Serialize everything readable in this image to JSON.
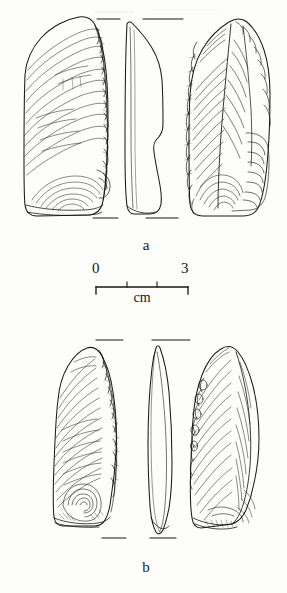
{
  "plate": {
    "type": "archaeological-lithic-illustration",
    "background_color": "#fdfdfc",
    "ink_color": "#1a1a1a",
    "width": 287,
    "height": 593
  },
  "figures": [
    {
      "id": "a",
      "label": "a",
      "label_x": 126,
      "label_y": 240,
      "views": [
        "ventral",
        "profile",
        "dorsal"
      ],
      "registration_ticks": {
        "top_y": 19,
        "bottom_y": 218,
        "segments": [
          [
            97,
            120
          ],
          [
            143,
            183
          ]
        ]
      }
    },
    {
      "id": "b",
      "label": "b",
      "label_x": 126,
      "label_y": 562,
      "views": [
        "ventral",
        "profile",
        "dorsal"
      ],
      "registration_ticks": {
        "top_y": 340,
        "bottom_y": 538,
        "segments": [
          [
            96,
            123
          ],
          [
            152,
            190
          ]
        ]
      }
    }
  ],
  "scale_bar": {
    "min_label": "0",
    "max_label": "3",
    "unit_label": "cm",
    "min_value": 0,
    "max_value": 3,
    "tick_values": [
      0,
      1,
      2,
      3
    ],
    "bar_left": 96,
    "bar_right": 188,
    "bar_y": 287,
    "min_label_x": 92,
    "min_label_y": 262,
    "max_label_x": 182,
    "max_label_y": 262,
    "unit_x": 112,
    "unit_y": 291
  }
}
